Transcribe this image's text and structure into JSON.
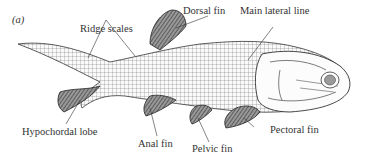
{
  "figure": {
    "panel_label": "(a)",
    "labels": {
      "ridge_scales": "Ridge scales",
      "dorsal_fin": "Dorsal fin",
      "main_lateral_line": "Main lateral line",
      "hypochordal_lobe": "Hypochordal lobe",
      "anal_fin": "Anal fin",
      "pelvic_fin": "Pelvic fin",
      "pectoral_fin": "Pectoral fin"
    },
    "colors": {
      "ink": "#2a2a2a",
      "fin_shade": "#555555",
      "background": "#ffffff"
    }
  }
}
